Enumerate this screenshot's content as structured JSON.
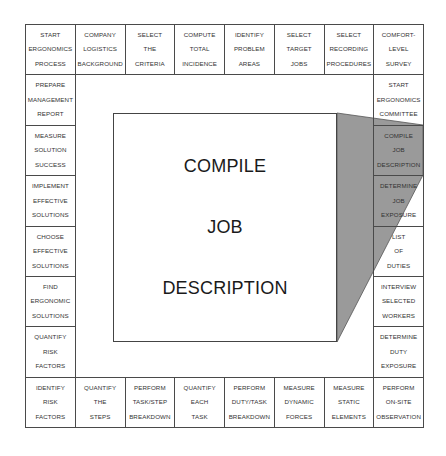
{
  "diagram": {
    "center": {
      "lines": [
        "COMPILE",
        "JOB",
        "DESCRIPTION"
      ]
    },
    "colors": {
      "border": "#4a4a4a",
      "shade": "#9a9a9a",
      "background": "#ffffff"
    },
    "top_row": [
      {
        "lines": [
          "START",
          "ERGONOMICS",
          "PROCESS"
        ]
      },
      {
        "lines": [
          "COMPANY",
          "LOGISTICS",
          "BACKGROUND"
        ]
      },
      {
        "lines": [
          "SELECT",
          "THE",
          "CRITERIA"
        ]
      },
      {
        "lines": [
          "COMPUTE",
          "TOTAL",
          "INCIDENCE"
        ]
      },
      {
        "lines": [
          "IDENTIFY",
          "PROBLEM",
          "AREAS"
        ]
      },
      {
        "lines": [
          "SELECT",
          "TARGET",
          "JOBS"
        ]
      },
      {
        "lines": [
          "SELECT",
          "RECORDING",
          "PROCEDURES"
        ]
      },
      {
        "lines": [
          "COMFORT-",
          "LEVEL",
          "SURVEY"
        ]
      }
    ],
    "right_column": [
      {
        "lines": [
          "START",
          "ERGONOMICS",
          "COMMITTEE"
        ]
      },
      {
        "lines": [
          "COMPILE",
          "JOB",
          "DESCRIPTION"
        ],
        "highlighted": true
      },
      {
        "lines": [
          "DETERMINE",
          "JOB",
          "EXPOSURE"
        ],
        "highlighted": true
      },
      {
        "lines": [
          "LIST",
          "OF",
          "DUTIES"
        ]
      },
      {
        "lines": [
          "INTERVIEW",
          "SELECTED",
          "WORKERS"
        ]
      },
      {
        "lines": [
          "DETERMINE",
          "DUTY",
          "EXPOSURE"
        ]
      }
    ],
    "bottom_row": [
      {
        "lines": [
          "IDENTIFY",
          "RISK",
          "FACTORS"
        ]
      },
      {
        "lines": [
          "QUANTIFY",
          "THE",
          "STEPS"
        ]
      },
      {
        "lines": [
          "PERFORM",
          "TASK/STEP",
          "BREAKDOWN"
        ]
      },
      {
        "lines": [
          "QUANTIFY",
          "EACH",
          "TASK"
        ]
      },
      {
        "lines": [
          "PERFORM",
          "DUTY/TASK",
          "BREAKDOWN"
        ]
      },
      {
        "lines": [
          "MEASURE",
          "DYNAMIC",
          "FORCES"
        ]
      },
      {
        "lines": [
          "MEASURE",
          "STATIC",
          "ELEMENTS"
        ]
      },
      {
        "lines": [
          "PERFORM",
          "ON-SITE",
          "OBSERVATION"
        ]
      }
    ],
    "left_column": [
      {
        "lines": [
          "PREPARE",
          "MANAGEMENT",
          "REPORT"
        ]
      },
      {
        "lines": [
          "MEASURE",
          "SOLUTION",
          "SUCCESS"
        ]
      },
      {
        "lines": [
          "IMPLEMENT",
          "EFFECTIVE",
          "SOLUTIONS"
        ]
      },
      {
        "lines": [
          "CHOOSE",
          "EFFECTIVE",
          "SOLUTIONS"
        ]
      },
      {
        "lines": [
          "FIND",
          "ERGONOMIC",
          "SOLUTIONS"
        ]
      },
      {
        "lines": [
          "QUANTIFY",
          "RISK",
          "FACTORS"
        ]
      }
    ]
  }
}
